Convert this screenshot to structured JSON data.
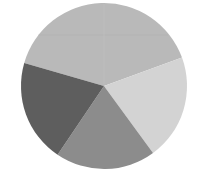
{
  "chart_data": {
    "type": "pie",
    "title": "",
    "categories": [
      "Slice A",
      "Slice B",
      "Slice C",
      "Slice D"
    ],
    "values": [
      40,
      20.5,
      19.5,
      20
    ],
    "colors": [
      "#b9b9b9",
      "#d3d3d3",
      "#8c8c8c",
      "#5e5e5e"
    ],
    "start_angle_deg": 286,
    "direction": "clockwise",
    "legend": [],
    "labels_shown": false
  },
  "layout": {
    "center": [
      104,
      86
    ],
    "radius": 83
  }
}
